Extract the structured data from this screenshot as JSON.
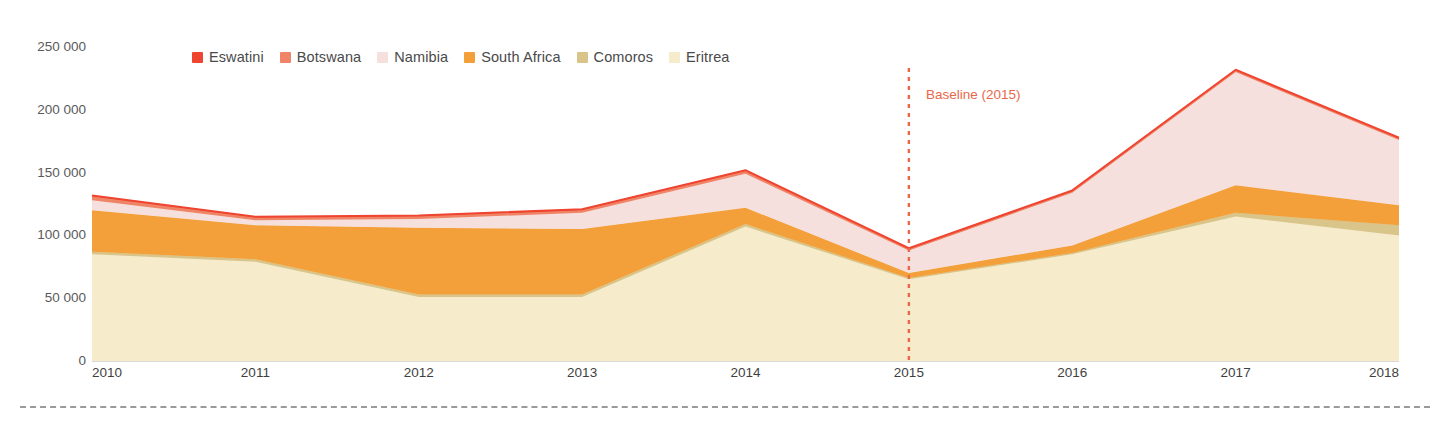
{
  "chart_data": {
    "type": "area",
    "stacked": true,
    "title": "",
    "xlabel": "",
    "ylabel": "",
    "grid": false,
    "legend_position": "top",
    "categories": [
      "2010",
      "2011",
      "2012",
      "2013",
      "2014",
      "2015",
      "2016",
      "2017",
      "2018"
    ],
    "x": [
      2010,
      2011,
      2012,
      2013,
      2014,
      2015,
      2016,
      2017,
      2018
    ],
    "ylim": [
      0,
      250000
    ],
    "ytick_values": [
      0,
      50000,
      100000,
      150000,
      200000,
      250000
    ],
    "ytick_labels": [
      "0",
      "50 000",
      "100 000",
      "150 000",
      "200 000",
      "250 000"
    ],
    "series": [
      {
        "name": "Eritrea",
        "color": "#f6eccc",
        "values": [
          85000,
          79000,
          51000,
          51000,
          107000,
          65000,
          85000,
          115000,
          100000
        ]
      },
      {
        "name": "Comoros",
        "color": "#d9c489",
        "values": [
          2000,
          2000,
          2000,
          2000,
          2000,
          1000,
          1000,
          3000,
          8000
        ]
      },
      {
        "name": "South Africa",
        "color": "#f3a03a",
        "values": [
          33000,
          27000,
          53000,
          52000,
          13000,
          4000,
          6000,
          22000,
          16000
        ]
      },
      {
        "name": "Namibia",
        "color": "#f6e0de",
        "values": [
          8000,
          4000,
          7000,
          13000,
          27000,
          18000,
          42000,
          90000,
          52000
        ]
      },
      {
        "name": "Botswana",
        "color": "#ef8466",
        "values": [
          3000,
          2000,
          2000,
          2000,
          2000,
          1000,
          1000,
          1000,
          1000
        ]
      },
      {
        "name": "Eswatini",
        "color": "#ef4430",
        "values": [
          1000,
          1000,
          1000,
          1000,
          1000,
          1000,
          1000,
          1000,
          1000
        ]
      }
    ],
    "cumulative_totals": [
      132000,
      115000,
      116000,
      121000,
      152000,
      90000,
      136000,
      232000,
      178000
    ],
    "annotations": [
      {
        "name": "baseline",
        "label": "Baseline (2015)",
        "x": 2015,
        "color": "#e8684a",
        "style": "dotted-vertical-line"
      }
    ]
  },
  "legend": {
    "items": [
      {
        "label": "Eswatini",
        "color": "#ef4430"
      },
      {
        "label": "Botswana",
        "color": "#ef8466"
      },
      {
        "label": "Namibia",
        "color": "#f6e0de"
      },
      {
        "label": "South Africa",
        "color": "#f3a03a"
      },
      {
        "label": "Comoros",
        "color": "#d9c489"
      },
      {
        "label": "Eritrea",
        "color": "#f6eccc"
      }
    ]
  },
  "axis": {
    "y_ticks": [
      "250 000",
      "200 000",
      "150 000",
      "100 000",
      "50 000",
      "0"
    ],
    "x_ticks": [
      "2010",
      "2011",
      "2012",
      "2013",
      "2014",
      "2015",
      "2016",
      "2017",
      "2018"
    ]
  },
  "colors": {
    "baseline": "#e8684a",
    "axis_text": "#4a4a4a",
    "divider": "#9a9a9a"
  }
}
